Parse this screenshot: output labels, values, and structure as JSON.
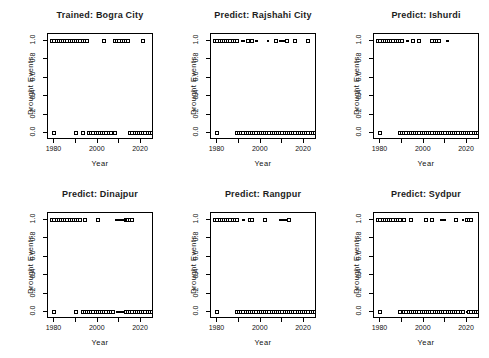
{
  "page": {
    "background": "#ffffff",
    "ink": "#000000",
    "title_color": "#1c1c1c"
  },
  "chart_data": {
    "type": "scatter",
    "layout": "grid-2x3",
    "shared_axes": {
      "xlabel": "Year",
      "ylabel": "Drought Events",
      "xlim": [
        1977,
        2026
      ],
      "ylim": [
        0,
        1
      ],
      "x_ticks": [
        1980,
        1990,
        2000,
        2010,
        2020
      ],
      "x_labeled_ticks": [
        1980,
        2000,
        2020
      ],
      "x_tick_labels": [
        "1980",
        "2000",
        "2020"
      ],
      "y_tick_values": [
        0.0,
        0.2,
        0.4,
        0.6,
        0.8,
        1.0
      ],
      "y_tick_labels": [
        "0.0",
        "0.2",
        "0.4",
        "0.6",
        "0.8",
        "1.0"
      ],
      "grid": false,
      "marker": "open-square"
    },
    "subplots": [
      {
        "title": "Trained: Bogra City",
        "ones": [
          1979,
          1980,
          1981,
          1982,
          1983,
          1984,
          1985,
          1986,
          1987,
          1988,
          1989,
          1990,
          1991,
          1992,
          1993,
          1994,
          1995,
          2003,
          2008,
          2009,
          2010,
          2011,
          2012,
          2013,
          2014,
          2021
        ],
        "zeros": [
          1980,
          1990,
          1993,
          1996,
          1997,
          1998,
          1999,
          2000,
          2001,
          2002,
          2003,
          2004,
          2005,
          2006,
          2008,
          2015,
          2016,
          2017,
          2018,
          2019,
          2020,
          2021,
          2022,
          2023,
          2024,
          2025
        ],
        "one_dashes": [],
        "zero_dashes": []
      },
      {
        "title": "Predict: Rajshahi City",
        "ones": [
          1979,
          1980,
          1981,
          1982,
          1983,
          1984,
          1985,
          1986,
          1987,
          1988,
          1989,
          1994,
          1996,
          2007,
          2012,
          2016,
          2022
        ],
        "zeros": [
          1980,
          1989,
          1990,
          1991,
          1992,
          1993,
          1994,
          1995,
          1996,
          1997,
          1998,
          1999,
          2000,
          2001,
          2002,
          2003,
          2004,
          2005,
          2006,
          2007,
          2008,
          2009,
          2010,
          2011,
          2012,
          2013,
          2014,
          2015,
          2016,
          2017,
          2018,
          2019,
          2020,
          2021,
          2022,
          2023,
          2024,
          2025,
          2026
        ],
        "one_dashes": [
          [
            1991,
            1992.5
          ],
          [
            1997.5,
            1998.5
          ],
          [
            2003,
            2004
          ],
          [
            2008.5,
            2011.5
          ]
        ],
        "zero_dashes": []
      },
      {
        "title": "Predict: Ishurdi",
        "ones": [
          1979,
          1980,
          1981,
          1982,
          1983,
          1984,
          1985,
          1986,
          1987,
          1988,
          1989,
          1990,
          1995,
          1998,
          2004,
          2005,
          2006,
          2007
        ],
        "zeros": [
          1980,
          1989,
          1990,
          1991,
          1992,
          1993,
          1994,
          1995,
          1996,
          1997,
          1998,
          1999,
          2000,
          2001,
          2002,
          2003,
          2004,
          2005,
          2006,
          2007,
          2008,
          2009,
          2010,
          2011,
          2012,
          2013,
          2014,
          2015,
          2016,
          2017,
          2018,
          2019,
          2020,
          2021,
          2022,
          2023,
          2024,
          2025,
          2026
        ],
        "one_dashes": [
          [
            1992,
            1993
          ],
          [
            2010.5,
            2011.5
          ]
        ],
        "zero_dashes": []
      },
      {
        "title": "Predict: Dinajpur",
        "ones": [
          1979,
          1980,
          1981,
          1982,
          1983,
          1984,
          1985,
          1986,
          1987,
          1988,
          1989,
          1990,
          1991,
          1992,
          1994,
          2000,
          2013,
          2014,
          2015,
          2016
        ],
        "zeros": [
          1980,
          1990,
          1993,
          1994,
          1995,
          1996,
          1997,
          1998,
          1999,
          2000,
          2001,
          2002,
          2003,
          2004,
          2005,
          2006,
          2007,
          2013,
          2014,
          2015,
          2016,
          2017,
          2018,
          2019,
          2020,
          2021,
          2022,
          2023,
          2024,
          2025,
          2026
        ],
        "one_dashes": [
          [
            2008,
            2013
          ]
        ],
        "zero_dashes": [
          [
            2008.5,
            2012.5
          ]
        ]
      },
      {
        "title": "Predict: Rangpur",
        "ones": [
          1979,
          1980,
          1981,
          1982,
          1983,
          1984,
          1985,
          1986,
          1987,
          1988,
          1989,
          1995,
          1996,
          2002,
          2013
        ],
        "zeros": [
          1980,
          1989,
          1990,
          1991,
          1992,
          1993,
          1994,
          1995,
          1996,
          1997,
          1998,
          1999,
          2000,
          2001,
          2002,
          2003,
          2004,
          2005,
          2006,
          2007,
          2008,
          2009,
          2010,
          2011,
          2012,
          2013,
          2014,
          2015,
          2016,
          2017,
          2018,
          2019,
          2020,
          2021,
          2022,
          2023,
          2024,
          2025,
          2026
        ],
        "one_dashes": [
          [
            1991.5,
            1992.5
          ],
          [
            2008.5,
            2012.5
          ]
        ],
        "zero_dashes": []
      },
      {
        "title": "Predict: Sydpur",
        "ones": [
          1979,
          1980,
          1981,
          1982,
          1983,
          1984,
          1985,
          1986,
          1987,
          1988,
          1989,
          1991,
          1994,
          2001,
          2004,
          2015,
          2020,
          2021,
          2022
        ],
        "zeros": [
          1980,
          1989,
          1991,
          1992,
          1993,
          1994,
          1995,
          1996,
          1997,
          1998,
          1999,
          2000,
          2001,
          2002,
          2003,
          2004,
          2005,
          2006,
          2007,
          2008,
          2009,
          2010,
          2011,
          2012,
          2013,
          2014,
          2015,
          2016,
          2017,
          2018,
          2021,
          2022,
          2023,
          2024,
          2025
        ],
        "one_dashes": [
          [
            2007.5,
            2010.5
          ],
          [
            2017.5,
            2018.5
          ]
        ],
        "zero_dashes": [
          [
            2019.5,
            2020.5
          ]
        ]
      }
    ]
  }
}
